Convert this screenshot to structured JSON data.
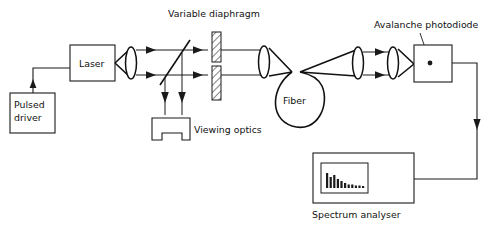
{
  "figure": {
    "kind": "optical-setup-block-diagram",
    "background_color": "#ffffff",
    "line_color": "#1a1a1a",
    "text_color": "#111111",
    "width": 493,
    "height": 229
  },
  "labels": {
    "pulsed_driver": "Pulsed\ndriver",
    "pulsed_driver_line1": "Pulsed",
    "pulsed_driver_line2": "driver",
    "laser": "Laser",
    "variable_diaphragm": "Variable diaphragm",
    "viewing_optics": "Viewing optics",
    "fiber": "Fiber",
    "avalanche_photodiode": "Avalanche photodiode",
    "spectrum_analyser": "Spectrum analyser"
  },
  "components": [
    {
      "id": "pulsed-driver",
      "label": "Pulsed driver",
      "shape": "rectangle"
    },
    {
      "id": "laser",
      "label": "Laser",
      "shape": "rectangle"
    },
    {
      "id": "lens-1",
      "label": "",
      "shape": "biconvex-lens"
    },
    {
      "id": "beam-splitter",
      "label": "",
      "shape": "diagonal-line"
    },
    {
      "id": "variable-diaphragm",
      "label": "Variable diaphragm",
      "shape": "hatched-aperture"
    },
    {
      "id": "viewing-optics",
      "label": "Viewing optics",
      "shape": "notched-box"
    },
    {
      "id": "lens-2",
      "label": "",
      "shape": "biconvex-lens"
    },
    {
      "id": "fiber",
      "label": "Fiber",
      "shape": "loop"
    },
    {
      "id": "lens-3",
      "label": "",
      "shape": "biconvex-lens"
    },
    {
      "id": "lens-4",
      "label": "",
      "shape": "biconvex-lens"
    },
    {
      "id": "avalanche-photodiode",
      "label": "Avalanche photodiode",
      "shape": "rectangle-with-dot"
    },
    {
      "id": "spectrum-analyser",
      "label": "Spectrum analyser",
      "shape": "instrument-with-screen"
    }
  ],
  "spectrum_display": {
    "description": "decreasing bar spectrum trace on analyser screen",
    "bar_heights": [
      12,
      9,
      10,
      7,
      6,
      4,
      3,
      3,
      2,
      2,
      2,
      2
    ]
  },
  "signal_paths": [
    {
      "id": "driver-to-laser",
      "from": "pulsed-driver",
      "to": "laser",
      "arrow": true
    },
    {
      "id": "apd-to-analyser",
      "from": "avalanche-photodiode",
      "to": "spectrum-analyser",
      "arrow": true
    }
  ]
}
